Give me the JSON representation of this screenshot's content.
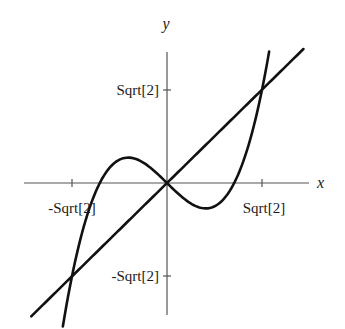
{
  "chart_data": {
    "type": "line",
    "title": "",
    "xlabel": "x",
    "ylabel": "y",
    "xlim": [
      -2.1,
      2.1
    ],
    "ylim": [
      -2.0,
      2.0
    ],
    "grid": false,
    "legend": null,
    "x_ticks": [
      {
        "value": -1.4142,
        "label": "-Sqrt[2]"
      },
      {
        "value": 1.4142,
        "label": "Sqrt[2]"
      }
    ],
    "y_ticks": [
      {
        "value": 1.4142,
        "label": "Sqrt[2]"
      },
      {
        "value": -1.4142,
        "label": "-Sqrt[2]"
      }
    ],
    "series": [
      {
        "name": "y = x^3 - x",
        "function": "x^3 - x",
        "x_range": [
          -1.55,
          1.52
        ]
      },
      {
        "name": "y = x",
        "function": "x",
        "x_range": [
          -2.02,
          2.03
        ]
      }
    ],
    "intersections": [
      [
        -1.4142,
        -1.4142
      ],
      [
        0,
        0
      ],
      [
        1.4142,
        1.4142
      ]
    ]
  },
  "labels": {
    "x_axis": "x",
    "y_axis": "y",
    "x_tick_neg": "-Sqrt[2]",
    "x_tick_pos": "Sqrt[2]",
    "y_tick_pos": "Sqrt[2]",
    "y_tick_neg": "-Sqrt[2]"
  },
  "colors": {
    "ink": "#111111",
    "axis": "#555555"
  }
}
